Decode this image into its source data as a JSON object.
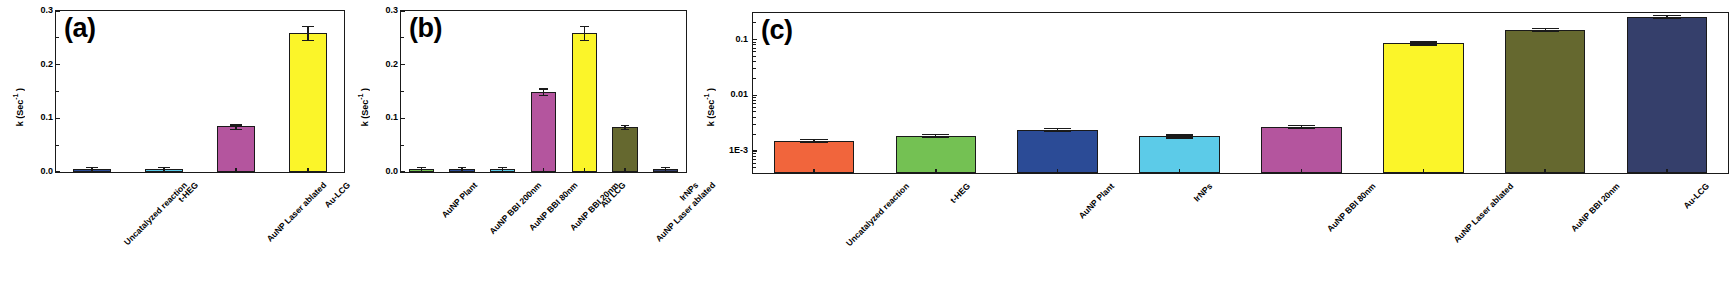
{
  "figure": {
    "panels": [
      "a",
      "b",
      "c"
    ]
  },
  "chart_data": [
    {
      "type": "bar",
      "panel_label": "(a)",
      "title": "",
      "xlabel": "",
      "ylabel": "k (Sec-1)",
      "ylabel_base": "k (Sec",
      "ylabel_exp": "-1",
      "ylabel_tail": " )",
      "yscale": "linear",
      "ylim": [
        0,
        0.3
      ],
      "yticks": [
        0.0,
        0.1,
        0.2,
        0.3
      ],
      "ytick_labels": [
        "0.0",
        "0.1",
        "0.2",
        "0.3"
      ],
      "grid": false,
      "legend": "none",
      "categories": [
        "Uncatalyzed reaction",
        "t-HEG",
        "AuNP Laser ablated",
        "Au-LCG"
      ],
      "values": [
        0.002,
        0.003,
        0.085,
        0.259
      ],
      "errors": [
        0.001,
        0.002,
        0.004,
        0.013
      ],
      "colors": [
        "#2b4b96",
        "#5ccbe8",
        "#b4559e",
        "#fbf529"
      ]
    },
    {
      "type": "bar",
      "panel_label": "(b)",
      "title": "",
      "xlabel": "",
      "ylabel": "k (Sec-1)",
      "ylabel_base": "k (Sec",
      "ylabel_exp": "-1",
      "ylabel_tail": " )",
      "yscale": "linear",
      "ylim": [
        0,
        0.3
      ],
      "yticks": [
        0.0,
        0.1,
        0.2,
        0.3
      ],
      "ytick_labels": [
        "0.0",
        "0.1",
        "0.2",
        "0.3"
      ],
      "grid": false,
      "legend": "none",
      "categories": [
        "AuNP Plant",
        "AuNP BBI 200nm",
        "AuNP BBI 80nm",
        "AuNP BBI 20nm",
        "Au LCG",
        "AuNP Laser ablated",
        "IrNPs"
      ],
      "values": [
        0.003,
        0.0015,
        0.003,
        0.15,
        0.259,
        0.084,
        0.0015
      ],
      "errors": [
        0.001,
        0.0005,
        0.001,
        0.006,
        0.013,
        0.003,
        0.0005
      ],
      "colors": [
        "#74c153",
        "#2b4b96",
        "#5ccbe8",
        "#b4559e",
        "#fbf529",
        "#65682f",
        "#353f6b"
      ]
    },
    {
      "type": "bar",
      "panel_label": "(c)",
      "title": "",
      "xlabel": "",
      "ylabel": "k (Sec-1)",
      "ylabel_base": "k (Sec",
      "ylabel_exp": "-1",
      "ylabel_tail": " )",
      "yscale": "log",
      "ylim": [
        0.0004,
        0.3
      ],
      "yticks": [
        0.001,
        0.01,
        0.1
      ],
      "ytick_labels": [
        "1E-3",
        "0.01",
        "0.1"
      ],
      "grid": false,
      "legend": "none",
      "categories": [
        "Uncatalyzed reaction",
        "t-HEG",
        "AuNP Plant",
        "IrNPs",
        "AuNP BBI 80nm",
        "AuNP Laser ablated",
        "AuNP BBI 20nm",
        "Au-LCG"
      ],
      "values": [
        0.00152,
        0.00186,
        0.0024,
        0.00183,
        0.00268,
        0.085,
        0.15,
        0.259
      ],
      "errors": [
        6e-05,
        6e-05,
        8e-05,
        6e-05,
        8e-05,
        0.003,
        0.004,
        0.01
      ],
      "colors": [
        "#f1653c",
        "#74c153",
        "#2b4b96",
        "#5ccbe8",
        "#b4559e",
        "#fbf529",
        "#65682f",
        "#353f6b"
      ]
    }
  ]
}
